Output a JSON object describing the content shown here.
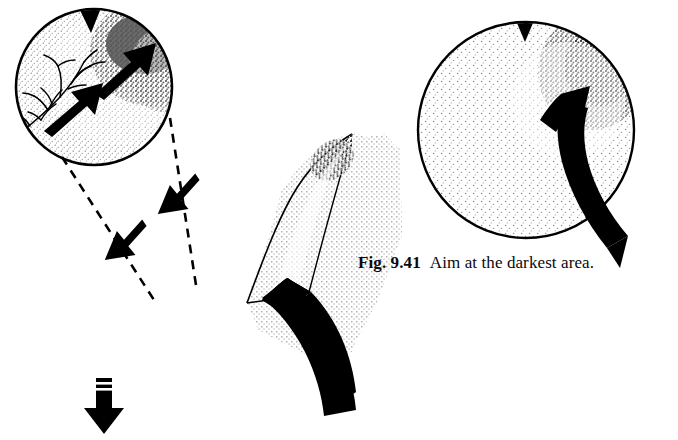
{
  "figure": {
    "caption_label": "Fig. 9.41",
    "caption_text": "Aim at the darkest area.",
    "colors": {
      "ink": "#000000",
      "background": "#ffffff",
      "stipple_light": "#9a9a9a",
      "stipple_dark": "#1a1a1a",
      "slab_tint": "#b8b8b8"
    }
  },
  "panels": {
    "magnified_inset": {
      "name": "magnified ball inset",
      "shape": "circle",
      "center_x": 94,
      "center_y": 87,
      "radius": 78,
      "notch_label": "top notch",
      "dark_zone": "upper-right",
      "branch_pattern": "dendritic branch lines at upper-left",
      "arrows": [
        {
          "label": "inner aim arrow lower",
          "direction": "up-right"
        },
        {
          "label": "inner aim arrow upper",
          "direction": "up-right"
        }
      ]
    },
    "slab": {
      "name": "curved stippled slab",
      "tint": "halftone dot screen",
      "wedge_label": "light wedge facet",
      "dark_edge": "dark stipple gradient along upper-left edge"
    },
    "black_band": {
      "name": "curved black band",
      "direction": "sweeps down-left"
    },
    "down_arrow": {
      "name": "force arrow",
      "direction": "down",
      "hatch_marks": 2
    },
    "callouts": [
      {
        "label": "right dashed callout line",
        "style": "dashed"
      },
      {
        "label": "left dashed callout line",
        "style": "dashed"
      }
    ],
    "callout_arrows": [
      {
        "label": "callout arrow upper",
        "direction": "down-left"
      },
      {
        "label": "callout arrow lower",
        "direction": "down-left"
      }
    ],
    "ball_main": {
      "name": "main ball",
      "shape": "circle",
      "center_x": 526,
      "center_y": 130,
      "radius": 108,
      "notch_label": "top notch",
      "dark_zone": "upper-right",
      "curved_arrow": {
        "label": "swing path arrow",
        "direction": "curves up toward upper-right"
      }
    }
  }
}
